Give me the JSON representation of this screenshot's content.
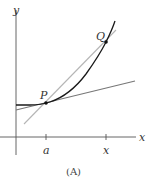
{
  "diagram": {
    "caption": "(A)",
    "axes": {
      "x_label": "x",
      "y_label": "y"
    },
    "ticks": [
      {
        "label": "a"
      },
      {
        "label": "x"
      }
    ],
    "points": [
      {
        "label": "P"
      },
      {
        "label": "Q"
      }
    ],
    "elements": {
      "curve": "increasing convex curve",
      "tangent_line": "tangent line at P",
      "secant_line": "secant line through P and Q"
    },
    "colors": {
      "curve": "#1a1a1a",
      "tangent": "#777777",
      "secant": "#b5b5b5",
      "axes": "#555555"
    }
  }
}
